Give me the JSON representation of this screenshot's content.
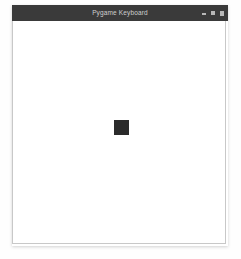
{
  "desktop": {
    "background_color": "#fefefe"
  },
  "window": {
    "title": "Pygame Keyboard",
    "title_bar_color": "#3a3a3a",
    "title_text_color": "#cfcfcf",
    "border_color": "#c8c8c8",
    "controls": [
      {
        "name": "minimize",
        "glyph": ""
      },
      {
        "name": "maximize",
        "glyph": ""
      },
      {
        "name": "close",
        "glyph": ""
      }
    ]
  },
  "canvas": {
    "background_color": "#ffffff",
    "sprite": {
      "label": "player-square",
      "color": "#2b2b2b",
      "x": 101,
      "y": 99,
      "width": 15,
      "height": 15
    }
  }
}
